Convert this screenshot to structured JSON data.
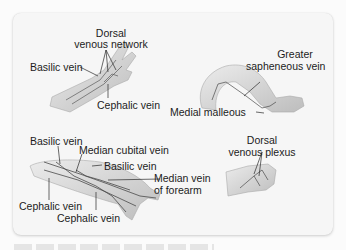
{
  "figure": {
    "panels": [
      {
        "id": "hand-arm-dorsal",
        "labels": {
          "dorsal_network": "Dorsal\nvenous network",
          "dorsal_network_line1": "Dorsal",
          "dorsal_network_line2": "venous network",
          "basilic": "Basilic vein",
          "cephalic": "Cephalic vein"
        }
      },
      {
        "id": "leg",
        "labels": {
          "greater_saphenous_line1": "Greater",
          "greater_saphenous_line2": "sapheneous vein",
          "medial_malleolus": "Medial malleous"
        }
      },
      {
        "id": "forearm",
        "labels": {
          "basilic_top": "Basilic vein",
          "median_cubital": "Median cubital vein",
          "basilic_mid": "Basilic vein",
          "median_forearm_line1": "Median vein",
          "median_forearm_line2": "of forearm",
          "cephalic_left": "Cephalic vein",
          "cephalic_bottom": "Cephalic vein"
        }
      },
      {
        "id": "foot",
        "labels": {
          "dorsal_plexus_line1": "Dorsal",
          "dorsal_plexus_line2": "venous plexus"
        }
      }
    ],
    "colors": {
      "card_bg": "#f6f6f6",
      "page_bg": "#fbfbfb",
      "skin": "#dcdcdc",
      "skin_shade": "#bdbdbd",
      "vein": "#4a4a4a",
      "leader": "#2a2a2a"
    }
  }
}
